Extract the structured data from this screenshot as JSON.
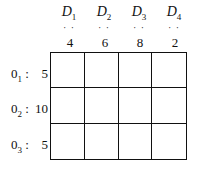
{
  "destinations": [
    {
      "name": "D",
      "sub": "1",
      "dots": "· ·",
      "demand": "4"
    },
    {
      "name": "D",
      "sub": "2",
      "dots": "· ·",
      "demand": "6"
    },
    {
      "name": "D",
      "sub": "3",
      "dots": "· ·",
      "demand": "8"
    },
    {
      "name": "D",
      "sub": "4",
      "dots": "· ·",
      "demand": "2"
    }
  ],
  "origins": [
    {
      "name": "0",
      "sub": "1",
      "sep": ":",
      "supply": "5"
    },
    {
      "name": "0",
      "sub": "2",
      "sep": ":",
      "supply": "10"
    },
    {
      "name": "0",
      "sub": "3",
      "sep": ":",
      "supply": "5"
    }
  ],
  "cells": [
    [
      "",
      "",
      "",
      ""
    ],
    [
      "",
      "",
      "",
      ""
    ],
    [
      "",
      "",
      "",
      ""
    ]
  ]
}
